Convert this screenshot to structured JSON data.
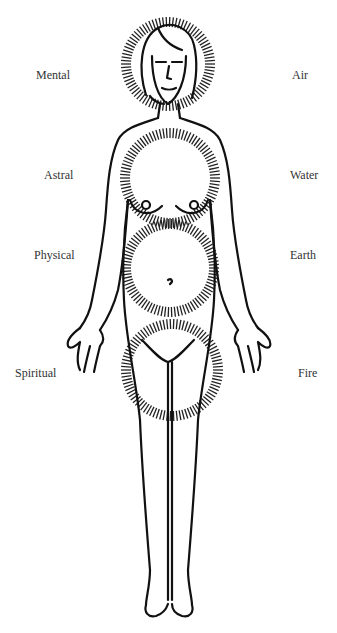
{
  "diagram": {
    "type": "body-energy-centers",
    "left_labels": [
      {
        "text": "Mental",
        "y": 76
      },
      {
        "text": "Astral",
        "y": 176
      },
      {
        "text": "Physical",
        "y": 256
      },
      {
        "text": "Spiritual",
        "y": 373
      }
    ],
    "right_labels": [
      {
        "text": "Air",
        "y": 76
      },
      {
        "text": "Water",
        "y": 176
      },
      {
        "text": "Earth",
        "y": 256
      },
      {
        "text": "Fire",
        "y": 373
      }
    ],
    "halos": [
      {
        "name": "head",
        "cx": 168,
        "cy": 64,
        "r": 42
      },
      {
        "name": "chest",
        "cx": 170,
        "cy": 178,
        "r": 45
      },
      {
        "name": "abdomen",
        "cx": 170,
        "cy": 268,
        "r": 44
      },
      {
        "name": "pelvis",
        "cx": 172,
        "cy": 370,
        "r": 46
      }
    ],
    "colors": {
      "ink": "#111111",
      "label": "#333333",
      "background": "#ffffff"
    }
  }
}
